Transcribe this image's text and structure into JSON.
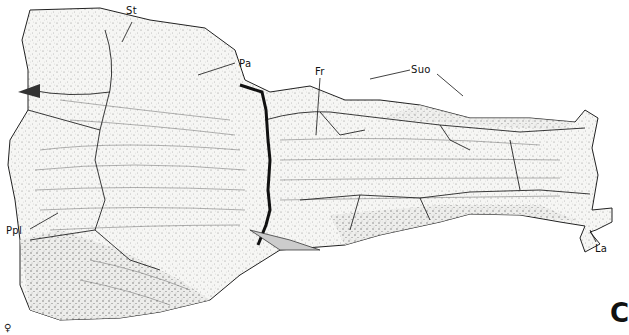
{
  "figure": {
    "panel_letter": "C",
    "sex_symbol": "♀",
    "specimen": "skull roof, dorsal view (stippled illustration)",
    "colors": {
      "ink": "#111111",
      "stipple": "#555555",
      "background": "#ffffff",
      "fill": "#f4f4f2"
    }
  },
  "labels": [
    {
      "id": "st",
      "text": "St"
    },
    {
      "id": "pa",
      "text": "Pa"
    },
    {
      "id": "fr",
      "text": "Fr"
    },
    {
      "id": "suo",
      "text": "Suo"
    },
    {
      "id": "ppl",
      "text": "Ppl"
    },
    {
      "id": "la",
      "text": "La"
    }
  ]
}
